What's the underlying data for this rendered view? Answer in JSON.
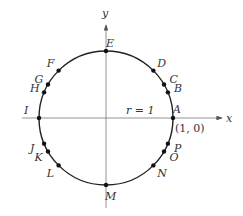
{
  "axes": {
    "x_label": "x",
    "y_label": "y"
  },
  "radius_label": "r = 1",
  "point_A_coord": "(1, 0)",
  "points": [
    {
      "label": "A",
      "angle": 0
    },
    {
      "label": "B",
      "angle": 22.5
    },
    {
      "label": "C",
      "angle": 30
    },
    {
      "label": "D",
      "angle": 45
    },
    {
      "label": "E",
      "angle": 90
    },
    {
      "label": "F",
      "angle": 135
    },
    {
      "label": "G",
      "angle": 150
    },
    {
      "label": "H",
      "angle": 157.5
    },
    {
      "label": "I",
      "angle": 180
    },
    {
      "label": "J",
      "angle": 202.5
    },
    {
      "label": "K",
      "angle": 210
    },
    {
      "label": "L",
      "angle": 225
    },
    {
      "label": "M",
      "angle": 270
    },
    {
      "label": "N",
      "angle": 315
    },
    {
      "label": "O",
      "angle": 330
    },
    {
      "label": "P",
      "angle": 337.5
    }
  ]
}
